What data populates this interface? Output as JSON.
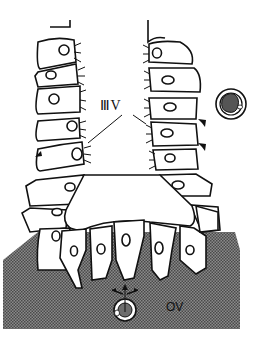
{
  "diagram": {
    "type": "biological-schematic",
    "labels": {
      "ventricle_label": "ⅢV",
      "ov_label": "OV"
    },
    "colors": {
      "stroke": "#111111",
      "tissue_fill": "#6e6e6e",
      "cell_fill": "#ffffff",
      "nucleus_dark": "#555555"
    },
    "elements": [
      {
        "name": "left-cell-column",
        "cells": 7
      },
      {
        "name": "right-cell-column",
        "cells": 7
      },
      {
        "name": "floor-cells",
        "cells": 7
      },
      {
        "name": "isolated-cell-dark-nucleus"
      },
      {
        "name": "ov-cell-in-tissue"
      },
      {
        "name": "migration-arrows",
        "count": 5
      }
    ]
  }
}
